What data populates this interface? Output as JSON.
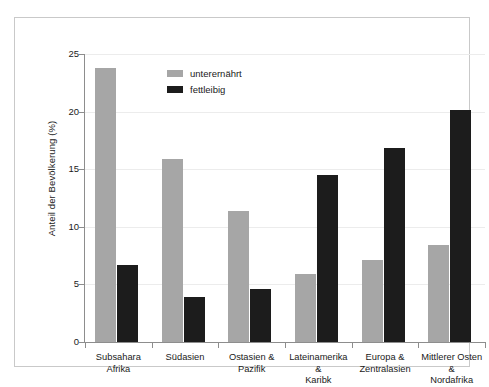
{
  "chart_data": {
    "type": "bar",
    "title": "",
    "xlabel": "",
    "ylabel": "Anteil der Bevölkerung (%)",
    "ylim": [
      0,
      25
    ],
    "yticks": [
      0,
      5,
      10,
      15,
      20,
      25
    ],
    "ytick_labels": [
      "0",
      "5",
      "10",
      "15",
      "20",
      "25"
    ],
    "grid": true,
    "legend_position": "upper-left-inside",
    "categories": [
      "Subsahara\nAfrika",
      "Südasien",
      "Ostasien &\nPazifik",
      "Lateinamerika &\nKaribk",
      "Europa &\nZentralasien",
      "Mittlerer Osten &\nNordafrika"
    ],
    "series": [
      {
        "name": "unterernährt",
        "color": "#a6a6a6",
        "values": [
          23.8,
          15.9,
          11.4,
          5.9,
          7.1,
          8.4
        ]
      },
      {
        "name": "fettleibig",
        "color": "#1c1c1c",
        "values": [
          6.7,
          3.9,
          4.6,
          14.5,
          16.8,
          20.1
        ]
      }
    ]
  },
  "figure": {
    "background": "#ffffff",
    "frame_color": "#c9c9c9",
    "axis_color": "#8d8d8d",
    "grid_color": "#ececec",
    "text_color": "#1a1a1a"
  }
}
